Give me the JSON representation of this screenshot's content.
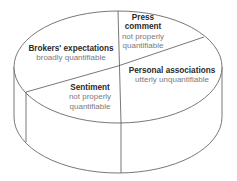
{
  "diagram": {
    "type": "3d-pie-cylinder",
    "stroke_color": "#555555",
    "title_color": "#2a2a2a",
    "subtitle_color": "#7a7a7a",
    "segments": [
      {
        "title": "Brokers' expectations",
        "subtitle": "broadly quantifiable"
      },
      {
        "title_line1": "Press",
        "title_line2": "comment",
        "subtitle_line1": "not properly",
        "subtitle_line2": "quantifiable"
      },
      {
        "title": "Personal associations",
        "subtitle": "utterly unquantifiable"
      },
      {
        "title": "Sentiment",
        "subtitle_line1": "not properly",
        "subtitle_line2": "quantifiable"
      }
    ]
  }
}
